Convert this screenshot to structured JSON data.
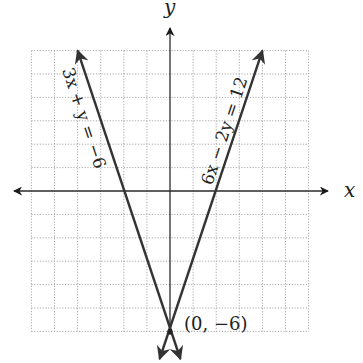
{
  "chart_data": {
    "type": "line",
    "title": "",
    "xlabel": "x",
    "ylabel": "y",
    "xlim": [
      -6,
      6
    ],
    "ylim": [
      -6,
      6
    ],
    "grid": true,
    "grid_style": "dotted",
    "legend": null,
    "series": [
      {
        "name": "3x + y = −6",
        "equation": "y = -3x - 6",
        "x": [
          -4,
          -2,
          0,
          0.45
        ],
        "y": [
          6,
          0,
          -6,
          -7.35
        ],
        "arrows": "both",
        "color": "#333333"
      },
      {
        "name": "6x − 2y = 12",
        "equation": "y = 3x - 6",
        "x": [
          4,
          2,
          0,
          -0.45
        ],
        "y": [
          6,
          0,
          -6,
          -7.35
        ],
        "arrows": "both",
        "color": "#333333"
      }
    ],
    "annotations": [
      {
        "text": "(0, −6)",
        "x": 0,
        "y": -6,
        "type": "point"
      }
    ]
  },
  "labels": {
    "x_axis": "x",
    "y_axis": "y",
    "eq_left": "3x + y = −6",
    "eq_right": "6x − 2y = 12",
    "vertex": "(0, −6)"
  },
  "colors": {
    "line": "#333333",
    "axis": "#2a2a2a",
    "grid": "#a8a8a8"
  }
}
